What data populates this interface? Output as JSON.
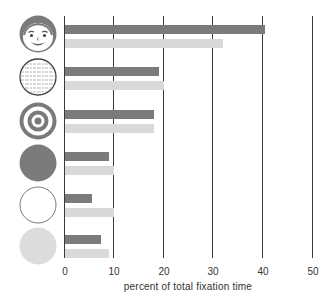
{
  "chart_data": {
    "type": "bar",
    "orientation": "horizontal",
    "title": "",
    "xlabel": "percent of total fixation time",
    "ylabel": "",
    "xlim": [
      0,
      50
    ],
    "xticks": [
      0,
      10,
      20,
      30,
      40,
      50
    ],
    "grid": true,
    "legend": null,
    "categories": [
      "face",
      "text",
      "target",
      "dark circle",
      "white circle",
      "light circle"
    ],
    "category_icons": [
      "face-icon",
      "text-block-circle-icon",
      "target-icon",
      "dark-gray-circle-icon",
      "white-circle-icon",
      "light-gray-circle-icon"
    ],
    "series": [
      {
        "name": "dark bars",
        "color": "#7b7b7b",
        "values": [
          40.5,
          19,
          18,
          9,
          5.5,
          7.3
        ]
      },
      {
        "name": "light bars",
        "color": "#d9d9d9",
        "values": [
          32,
          20,
          18,
          10,
          10,
          9
        ]
      }
    ]
  },
  "axis": {
    "tick_labels": [
      "0",
      "10",
      "20",
      "30",
      "40",
      "50"
    ],
    "label": "percent of total fixation time"
  },
  "colors": {
    "dark_bar": "#7b7b7b",
    "light_bar": "#d9d9d9",
    "gridline": "#3a3a3a"
  }
}
